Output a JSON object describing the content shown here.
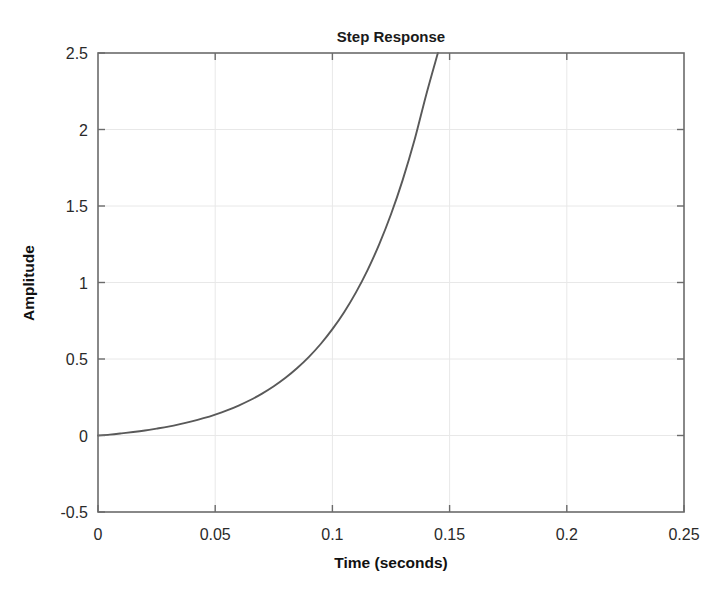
{
  "figure": {
    "background_color": "#ffffff",
    "frame_color": "#6b6b6b",
    "grid_color": "#e8e8e8",
    "curve_color": "#595959",
    "title": "Step Response",
    "xlabel": "Time (seconds)",
    "ylabel": "Amplitude"
  },
  "chart_data": {
    "type": "line",
    "title": "Step Response",
    "xlabel": "Time (seconds)",
    "ylabel": "Amplitude",
    "xlim": [
      0,
      0.25
    ],
    "ylim": [
      -0.5,
      2.5
    ],
    "grid": true,
    "legend": null,
    "xticks": [
      0,
      0.05,
      0.1,
      0.15,
      0.2,
      0.25
    ],
    "xtick_labels": [
      "0",
      "0.05",
      "0.1",
      "0.15",
      "0.2",
      "0.25"
    ],
    "yticks": [
      -0.5,
      0,
      0.5,
      1,
      1.5,
      2,
      2.5
    ],
    "ytick_labels": [
      "-0.5",
      "0",
      "0.5",
      "1",
      "1.5",
      "2",
      "2.5"
    ],
    "series": [
      {
        "name": "step response",
        "color": "#595959",
        "linewidth": 1.9,
        "x": [
          0.0,
          0.005,
          0.01,
          0.015,
          0.02,
          0.025,
          0.03,
          0.035,
          0.04,
          0.045,
          0.05,
          0.055,
          0.06,
          0.065,
          0.07,
          0.075,
          0.08,
          0.085,
          0.09,
          0.095,
          0.1,
          0.105,
          0.11,
          0.115,
          0.12,
          0.125,
          0.13,
          0.135,
          0.14,
          0.145,
          0.15,
          0.155,
          0.159
        ],
        "y": [
          0.0,
          0.006,
          0.014,
          0.023,
          0.033,
          0.045,
          0.058,
          0.074,
          0.092,
          0.113,
          0.137,
          0.164,
          0.196,
          0.232,
          0.274,
          0.322,
          0.377,
          0.441,
          0.514,
          0.598,
          0.695,
          0.806,
          0.934,
          1.081,
          1.251,
          1.446,
          1.671,
          1.929,
          2.226,
          2.568,
          2.5,
          2.5,
          2.5
        ]
      }
    ],
    "annotations": []
  },
  "ticks": {
    "x_positions_px": [
      98,
      215.2,
      332.4,
      449.6,
      566.8,
      684
    ],
    "y_positions_px": [
      512,
      435.5,
      359,
      282.5,
      206,
      129.5,
      53
    ]
  },
  "plot_box_px": {
    "left": 98,
    "top": 53,
    "right": 684,
    "bottom": 512
  }
}
